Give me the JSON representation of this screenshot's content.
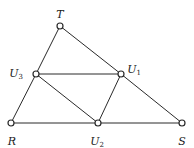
{
  "diagram": {
    "type": "triangle-subdivision",
    "nodes": [
      {
        "id": "T",
        "label": "T",
        "sub": "",
        "x": 60,
        "y": 26,
        "lx": 60,
        "ly": 15
      },
      {
        "id": "U3",
        "label": "U",
        "sub": "3",
        "x": 36,
        "y": 74,
        "lx": 16,
        "ly": 74
      },
      {
        "id": "U1",
        "label": "U",
        "sub": "1",
        "x": 121,
        "y": 74,
        "lx": 134,
        "ly": 70
      },
      {
        "id": "R",
        "label": "R",
        "sub": "",
        "x": 11,
        "y": 123,
        "lx": 12,
        "ly": 142
      },
      {
        "id": "U2",
        "label": "U",
        "sub": "2",
        "x": 98,
        "y": 123,
        "lx": 97,
        "ly": 142
      },
      {
        "id": "S",
        "label": "S",
        "sub": "",
        "x": 182,
        "y": 123,
        "lx": 182,
        "ly": 142
      }
    ],
    "edges": [
      [
        "T",
        "U3"
      ],
      [
        "U3",
        "R"
      ],
      [
        "T",
        "U1"
      ],
      [
        "U1",
        "S"
      ],
      [
        "R",
        "U2"
      ],
      [
        "U2",
        "S"
      ],
      [
        "U3",
        "U1"
      ],
      [
        "U3",
        "U2"
      ],
      [
        "U1",
        "U2"
      ]
    ]
  }
}
